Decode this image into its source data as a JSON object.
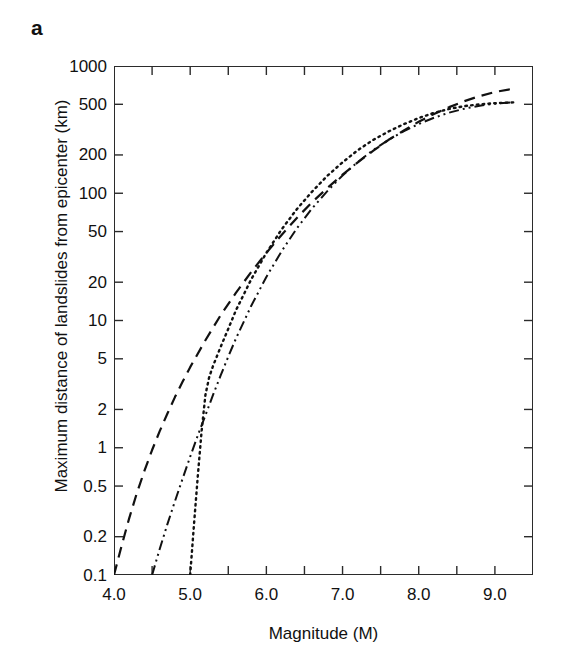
{
  "figure": {
    "panel_label": "a",
    "background_color": "#ffffff",
    "axis_color": "#2b2b2b",
    "curve_color": "#111111"
  },
  "chart_data": {
    "type": "line",
    "title": "",
    "subtitle": "",
    "xlabel": "Magnitude (M)",
    "ylabel": "Maximum distance of landslides from epicenter (km)",
    "xscale": "linear",
    "yscale": "log",
    "xlim": [
      4.0,
      9.5
    ],
    "ylim": [
      0.1,
      1000
    ],
    "grid": false,
    "legend": "none",
    "xticks": [
      4.0,
      4.5,
      5.0,
      5.5,
      6.0,
      6.5,
      7.0,
      7.5,
      8.0,
      8.5,
      9.0,
      9.5
    ],
    "xtick_labels": [
      "4.0",
      "",
      "5.0",
      "",
      "6.0",
      "",
      "7.0",
      "",
      "8.0",
      "",
      "9.0",
      ""
    ],
    "yticks": [
      0.1,
      0.2,
      0.5,
      1,
      2,
      5,
      10,
      20,
      50,
      100,
      200,
      500,
      1000
    ],
    "ytick_labels": [
      "0.1",
      "0.2",
      "0.5",
      "1",
      "2",
      "5",
      "10",
      "20",
      "50",
      "100",
      "200",
      "500",
      "1000"
    ],
    "annotations": [],
    "series": [
      {
        "name": "curve-dashed",
        "style": "dashed",
        "dasharray": "11,7",
        "width": 2.2,
        "x": [
          4.0,
          4.1,
          4.2,
          4.3,
          4.4,
          4.5,
          4.6,
          4.7,
          4.8,
          4.9,
          5.0,
          5.2,
          5.4,
          5.6,
          5.8,
          6.0,
          6.2,
          6.4,
          6.6,
          6.8,
          7.0,
          7.2,
          7.4,
          7.6,
          7.8,
          8.0,
          8.2,
          8.4,
          8.6,
          8.8,
          9.0,
          9.25
        ],
        "y": [
          0.1,
          0.17,
          0.28,
          0.44,
          0.66,
          0.96,
          1.35,
          1.85,
          2.5,
          3.3,
          4.3,
          7.0,
          11.0,
          16.5,
          24,
          34,
          47,
          64,
          85,
          110,
          140,
          175,
          215,
          262,
          310,
          365,
          420,
          475,
          530,
          580,
          625,
          665
        ]
      },
      {
        "name": "curve-dash-dot-dot",
        "style": "dash-dot-dot",
        "dasharray": "10,4,2,4,2,4",
        "width": 2.0,
        "x": [
          4.5,
          4.6,
          4.7,
          4.8,
          4.9,
          5.0,
          5.1,
          5.2,
          5.3,
          5.4,
          5.5,
          5.6,
          5.8,
          6.0,
          6.2,
          6.4,
          6.6,
          6.8,
          7.0,
          7.2,
          7.4,
          7.6,
          7.8,
          8.0,
          8.2,
          8.4,
          8.6,
          8.8,
          9.0,
          9.25
        ],
        "y": [
          0.1,
          0.16,
          0.25,
          0.38,
          0.57,
          0.85,
          1.25,
          1.8,
          2.6,
          3.7,
          5.2,
          7.2,
          13.0,
          22,
          35,
          53,
          76,
          104,
          138,
          176,
          218,
          262,
          307,
          350,
          392,
          430,
          462,
          488,
          505,
          520
        ]
      },
      {
        "name": "curve-dotted",
        "style": "dotted",
        "dasharray": "1.6,4.2",
        "width": 2.4,
        "x": [
          5.0,
          5.05,
          5.1,
          5.15,
          5.2,
          5.25,
          5.3,
          5.4,
          5.5,
          5.6,
          5.8,
          6.0,
          6.2,
          6.4,
          6.6,
          6.8,
          7.0,
          7.2,
          7.4,
          7.6,
          7.8,
          8.0,
          8.2,
          8.4,
          8.6,
          8.8,
          9.0,
          9.25
        ],
        "y": [
          0.1,
          0.25,
          0.6,
          1.35,
          2.6,
          3.6,
          4.4,
          6.2,
          8.6,
          12.0,
          21,
          34,
          52,
          75,
          103,
          137,
          175,
          218,
          262,
          305,
          348,
          390,
          428,
          460,
          484,
          500,
          510,
          518
        ]
      }
    ]
  }
}
